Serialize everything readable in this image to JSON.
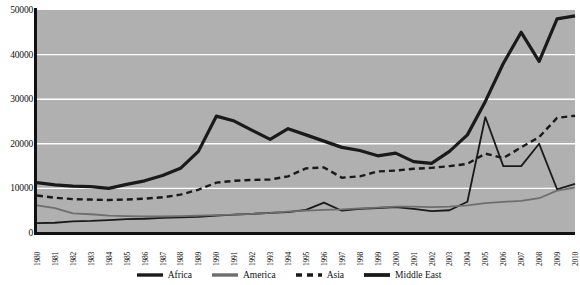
{
  "chart_data": {
    "type": "line",
    "title": "",
    "xlabel": "",
    "ylabel": "",
    "ylim": [
      0,
      50000
    ],
    "ytick_values": [
      50000,
      40000,
      30000,
      20000,
      10000,
      0
    ],
    "ytick_labels": [
      "50000",
      "40000",
      "30000",
      "20000",
      "10000",
      "0"
    ],
    "grid": true,
    "grid_color": "#ffffff",
    "plot_background": "#b0b0b0",
    "legend_position": "bottom",
    "x": [
      1980,
      1981,
      1982,
      1983,
      1984,
      1985,
      1986,
      1987,
      1988,
      1989,
      1990,
      1991,
      1992,
      1993,
      1994,
      1995,
      1996,
      1997,
      1998,
      1999,
      2000,
      2001,
      2002,
      2003,
      2004,
      2005,
      2006,
      2007,
      2008,
      2009,
      2010
    ],
    "categories": [
      "1980",
      "1981",
      "1982",
      "1983",
      "1984",
      "1985",
      "1986",
      "1987",
      "1988",
      "1989",
      "1990",
      "1991",
      "1992",
      "1993",
      "1994",
      "1995",
      "1996",
      "1997",
      "1998",
      "1999",
      "2000",
      "2001",
      "2002",
      "2003",
      "2004",
      "2005",
      "2006",
      "2007",
      "2008",
      "2009",
      "2010"
    ],
    "series": [
      {
        "name": "Africa",
        "color": "#1a1a1a",
        "style": "solid",
        "width": 1.8,
        "values": [
          2200,
          2300,
          2600,
          2700,
          2900,
          3100,
          3200,
          3400,
          3500,
          3600,
          3900,
          4100,
          4300,
          4500,
          4700,
          5200,
          6800,
          5000,
          5400,
          5600,
          5800,
          5400,
          4900,
          5100,
          7000,
          26000,
          15000,
          15000,
          20000,
          9800,
          11000
        ]
      },
      {
        "name": "America",
        "color": "#6e6e6e",
        "style": "solid",
        "width": 1.8,
        "values": [
          6200,
          5600,
          4400,
          4200,
          3900,
          3800,
          3700,
          3700,
          3800,
          3900,
          4000,
          4100,
          4300,
          4500,
          4800,
          5000,
          5200,
          5300,
          5500,
          5700,
          5900,
          5900,
          5800,
          5900,
          6200,
          6700,
          7000,
          7200,
          7800,
          9500,
          10200
        ]
      },
      {
        "name": "Asia",
        "color": "#1a1a1a",
        "style": "dashed",
        "width": 2.4,
        "values": [
          8400,
          7900,
          7600,
          7500,
          7400,
          7500,
          7700,
          8000,
          8600,
          9700,
          11300,
          11700,
          11900,
          12000,
          12700,
          14500,
          14700,
          12400,
          12700,
          13800,
          14000,
          14400,
          14600,
          15000,
          15500,
          17800,
          16800,
          19200,
          21500,
          25800,
          26300
        ]
      },
      {
        "name": "Middle East",
        "color": "#1a1a1a",
        "style": "solid",
        "width": 3.2,
        "values": [
          11300,
          10800,
          10500,
          10400,
          10000,
          10900,
          11700,
          12900,
          14500,
          18300,
          26200,
          25100,
          23000,
          21000,
          23400,
          22000,
          20600,
          19200,
          18500,
          17300,
          17900,
          16000,
          15600,
          18300,
          22000,
          29500,
          38000,
          45000,
          38500,
          48000,
          48700
        ]
      }
    ]
  },
  "legend": {
    "items": [
      {
        "label": "Africa"
      },
      {
        "label": "America"
      },
      {
        "label": "Asia"
      },
      {
        "label": "Middle East"
      }
    ]
  }
}
